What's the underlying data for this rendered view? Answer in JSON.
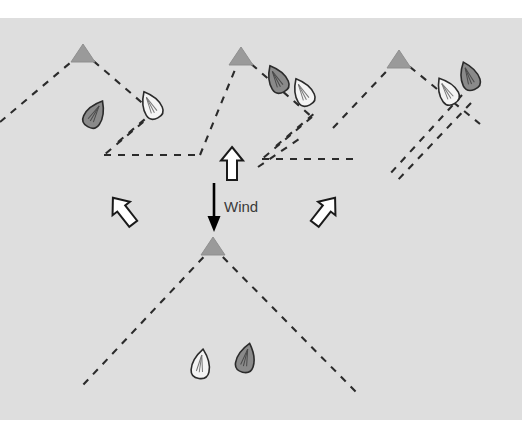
{
  "figure": {
    "background_color": "#dedede",
    "canvas_width": 522,
    "canvas_height": 447,
    "plot_top": 18,
    "plot_bottom": 420
  },
  "labels": {
    "wind": "Wind"
  },
  "colors": {
    "background": "#dedede",
    "mark_fill": "#9a9a9a",
    "mark_stroke": "#8c8c8c",
    "layline": "#2b2b2b",
    "boat_dark_fill": "#8a8a8a",
    "boat_light_fill": "#f2f2f2",
    "boat_stroke": "#2b2b2b",
    "arrow_white_fill": "#ffffff",
    "arrow_white_stroke": "#1a1a1a",
    "arrow_black_fill": "#000000",
    "text": "#3a3a3a"
  },
  "marks": [
    {
      "name": "mark-1-top-left",
      "x": 83,
      "y": 52
    },
    {
      "name": "mark-2-top-center",
      "x": 241,
      "y": 55
    },
    {
      "name": "mark-3-top-right",
      "x": 399,
      "y": 58
    },
    {
      "name": "mark-4-bottom-center",
      "x": 213,
      "y": 245
    }
  ],
  "laylines": [
    {
      "name": "layline-mark1-port-upper",
      "points": "0,122 83,52"
    },
    {
      "name": "layline-mark1-starboard-upper",
      "points": "83,52 152,112"
    },
    {
      "name": "layline-mark1-tack-down",
      "points": "152,112 104,154"
    },
    {
      "name": "layline-mark1-tack-out",
      "points": "104,154 152,112"
    },
    {
      "name": "layline-mark1-exit-right",
      "points": "104,154 197,154"
    },
    {
      "name": "layline-mark2-port-upper",
      "points": "197,154 241,55"
    },
    {
      "name": "layline-mark2-starboard-upper",
      "points": "241,55 310,116"
    },
    {
      "name": "layline-mark2-tack-down",
      "points": "310,116 262,158"
    },
    {
      "name": "layline-mark2-approach-long",
      "points": "262,158 355,158"
    },
    {
      "name": "layline-mark3-port-upper",
      "points": "336,126 399,58"
    },
    {
      "name": "layline-mark3-starboard-upper",
      "points": "399,58 478,123"
    },
    {
      "name": "layline-mark3-overstand-a",
      "points": "466,104 398,178"
    },
    {
      "name": "layline-mark3-overstand-b",
      "points": "457,96 392,172"
    },
    {
      "name": "layline-mark4-port-lower",
      "points": "213,245 83,383"
    },
    {
      "name": "layline-mark4-starboard-lower",
      "points": "213,245 352,390"
    }
  ],
  "boats": [
    {
      "name": "boat-mark1-dark",
      "x": 95,
      "y": 114,
      "rotation": 30,
      "shade": "dark"
    },
    {
      "name": "boat-mark1-light",
      "x": 151,
      "y": 105,
      "rotation": -28,
      "shade": "light"
    },
    {
      "name": "boat-mark2-dark",
      "x": 277,
      "y": 79,
      "rotation": -28,
      "shade": "dark"
    },
    {
      "name": "boat-mark2-light",
      "x": 303,
      "y": 92,
      "rotation": -28,
      "shade": "light"
    },
    {
      "name": "boat-mark3-light",
      "x": 447,
      "y": 91,
      "rotation": -32,
      "shade": "light"
    },
    {
      "name": "boat-mark3-dark",
      "x": 469,
      "y": 76,
      "rotation": -22,
      "shade": "dark"
    },
    {
      "name": "boat-bottom-light",
      "x": 201,
      "y": 364,
      "rotation": 8,
      "shade": "light"
    },
    {
      "name": "boat-bottom-dark",
      "x": 246,
      "y": 358,
      "rotation": 14,
      "shade": "dark"
    }
  ],
  "arrows": [
    {
      "name": "arrow-up-center",
      "x": 232,
      "y": 165,
      "rotation": 0,
      "style": "outline",
      "scale": 1.0
    },
    {
      "name": "arrow-up-left",
      "x": 124,
      "y": 212,
      "rotation": -38,
      "style": "outline",
      "scale": 1.0
    },
    {
      "name": "arrow-up-right",
      "x": 324,
      "y": 212,
      "rotation": 38,
      "style": "outline",
      "scale": 1.0
    },
    {
      "name": "arrow-wind-down-black",
      "x": 214,
      "y": 205,
      "rotation": 180,
      "style": "solid",
      "scale": 1.0
    }
  ],
  "wind_text_position": {
    "x": 224,
    "y": 212
  }
}
